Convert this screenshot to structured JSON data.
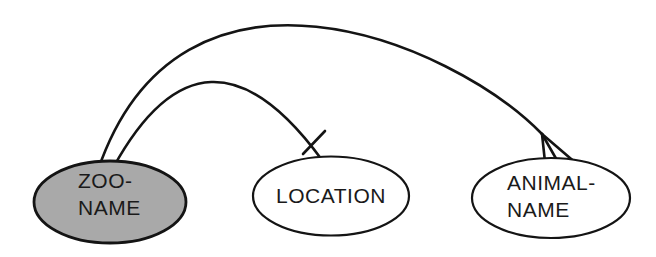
{
  "figure": {
    "background_color": "#ffffff",
    "line_color": "#141414",
    "text_color": "#1a1a1a"
  },
  "nodes": [
    {
      "id": "zoo-name",
      "label_line1": "ZOO-",
      "label_line2": "NAME",
      "fill": "#a9a9a9"
    },
    {
      "id": "location",
      "label_line1": "LOCATION",
      "fill": "#ffffff"
    },
    {
      "id": "animal-name",
      "label_line1": "ANIMAL-",
      "label_line2": "NAME",
      "fill": "#ffffff"
    }
  ],
  "edges": [
    {
      "from": "ZOO-NAME",
      "to": "LOCATION",
      "marker": "single-tick (one)"
    },
    {
      "from": "ZOO-NAME",
      "to": "ANIMAL-NAME",
      "marker": "crow-foot (many)"
    }
  ]
}
